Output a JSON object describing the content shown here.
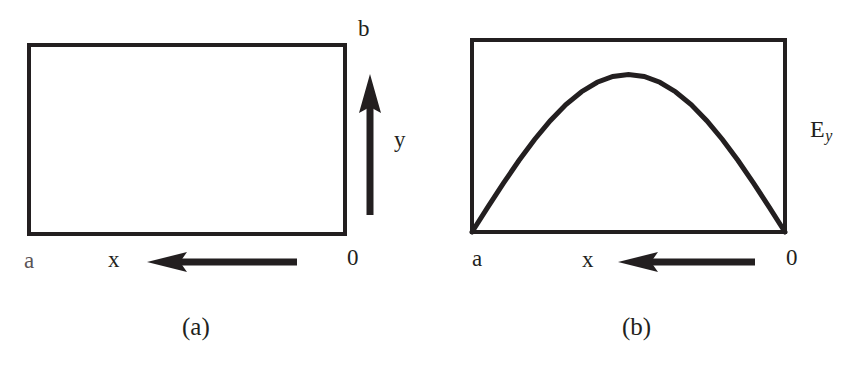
{
  "figure": {
    "background_color": "#ffffff",
    "ink_color": "#231f20"
  },
  "panel_a": {
    "caption": "(a)",
    "rect_name": "waveguide-cross-section",
    "labels": {
      "width_origin": "0",
      "width_end": "a",
      "horizontal_axis": "x",
      "height_end": "b",
      "vertical_axis": "y"
    },
    "arrows": {
      "x_axis_direction": "left",
      "y_axis_direction": "up"
    }
  },
  "panel_b": {
    "caption": "(b)",
    "rect_name": "waveguide-cross-section",
    "labels": {
      "width_origin": "0",
      "width_end": "a",
      "horizontal_axis": "x",
      "field": "E",
      "field_subscript": "y"
    },
    "arrows": {
      "x_axis_direction": "left"
    }
  },
  "chart_data": {
    "type": "line",
    "title": "",
    "xlabel": "x",
    "ylabel": "E_y",
    "x_axis_direction": "right-to-left",
    "xlim": [
      0,
      1
    ],
    "ylim": [
      0,
      1
    ],
    "grid": false,
    "legend": "none",
    "annotations": [
      "0",
      "a",
      "x",
      "E_y",
      "(b)"
    ],
    "series": [
      {
        "name": "E_y",
        "function": "sin(pi*x/a)",
        "x": [
          0.0,
          0.05,
          0.1,
          0.15,
          0.2,
          0.25,
          0.3,
          0.35,
          0.4,
          0.45,
          0.5,
          0.55,
          0.6,
          0.65,
          0.7,
          0.75,
          0.8,
          0.85,
          0.9,
          0.95,
          1.0
        ],
        "values": [
          0.0,
          0.156,
          0.309,
          0.454,
          0.588,
          0.707,
          0.809,
          0.891,
          0.951,
          0.988,
          1.0,
          0.988,
          0.951,
          0.891,
          0.809,
          0.707,
          0.588,
          0.454,
          0.309,
          0.156,
          0.0
        ]
      }
    ]
  }
}
